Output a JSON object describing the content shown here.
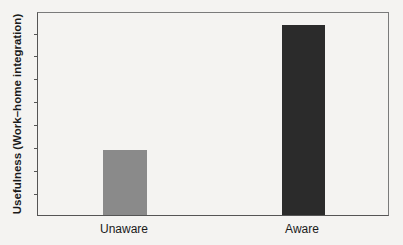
{
  "chart_data": {
    "type": "bar",
    "title": "",
    "xlabel": "",
    "ylabel": "Usefulness (Work–home integration)",
    "categories": [
      "Unaware",
      "Aware"
    ],
    "values": [
      3.2,
      9.4
    ],
    "ylim": [
      0,
      10
    ],
    "y_tick_count": 10,
    "y_tick_labels_shown": false,
    "grid": false,
    "legend": null,
    "colors": [
      "#8a8a8a",
      "#2b2b2b"
    ]
  },
  "axis": {
    "ylabel": "Usefulness (Work–home integration)"
  },
  "bars": [
    {
      "label": "Unaware",
      "value": 3.2,
      "color": "#8a8a8a"
    },
    {
      "label": "Aware",
      "value": 9.4,
      "color": "#2b2b2b"
    }
  ]
}
